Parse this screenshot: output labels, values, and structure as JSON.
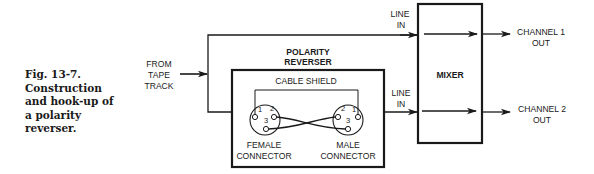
{
  "caption": {
    "lines": [
      "Fig. 13-7.",
      "Construction",
      "and hook-up of",
      "a polarity",
      "reverser."
    ]
  },
  "source": {
    "label_lines": [
      "FROM",
      "TAPE",
      "TRACK"
    ]
  },
  "polarity_reverser": {
    "title_lines": [
      "POLARITY",
      "REVERSER"
    ],
    "cable_shield_label": "CABLE SHIELD",
    "female_connector": {
      "label_lines": [
        "FEMALE",
        "CONNECTOR"
      ],
      "pins": [
        "1",
        "2",
        "3"
      ]
    },
    "male_connector": {
      "label_lines": [
        "MALE",
        "CONNECTOR"
      ],
      "pins": [
        "2",
        "1",
        "3"
      ]
    }
  },
  "mixer": {
    "label": "MIXER",
    "inputs": [
      {
        "label_lines": [
          "LINE",
          "IN"
        ]
      },
      {
        "label_lines": [
          "LINE",
          "IN"
        ]
      }
    ],
    "outputs": [
      {
        "label_lines": [
          "CHANNEL 1",
          "OUT"
        ]
      },
      {
        "label_lines": [
          "CHANNEL 2",
          "OUT"
        ]
      }
    ]
  },
  "colors": {
    "ink": "#1a1a1a",
    "background": "#ffffff"
  }
}
